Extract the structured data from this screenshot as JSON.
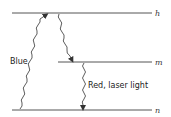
{
  "diagram": {
    "type": "energy-level-diagram",
    "levels": [
      {
        "id": "h",
        "label": "h",
        "y": 13,
        "x1": 12,
        "x2": 152
      },
      {
        "id": "m",
        "label": "m",
        "y": 62,
        "x1": 58,
        "x2": 152
      },
      {
        "id": "n",
        "label": "n",
        "y": 110,
        "x1": 12,
        "x2": 152
      }
    ],
    "transitions": [
      {
        "from": "n",
        "to": "h",
        "label": "Blue",
        "direction": "up"
      },
      {
        "from": "h",
        "to": "m",
        "label": "",
        "direction": "down"
      },
      {
        "from": "m",
        "to": "n",
        "label": "Red, laser light",
        "direction": "down"
      }
    ],
    "labels": {
      "blue": "Blue",
      "red": "Red, laser light",
      "h": "h",
      "m": "m",
      "n": "n"
    },
    "colors": {
      "line": "#555555",
      "arrow": "#333333",
      "text": "#222222"
    }
  }
}
